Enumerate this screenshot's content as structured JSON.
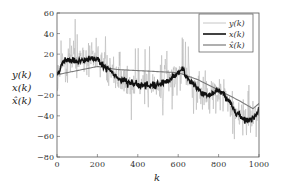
{
  "chart_data": {
    "type": "line",
    "title": "",
    "xlabel": "k",
    "ylabel_lines": [
      "y(k)",
      "x(k)",
      "x̂(k)"
    ],
    "xlim": [
      0,
      1000
    ],
    "ylim": [
      -80,
      60
    ],
    "xticks": [
      0,
      200,
      400,
      600,
      800,
      1000
    ],
    "yticks": [
      -80,
      -60,
      -40,
      -20,
      0,
      20,
      40,
      60
    ],
    "grid": false,
    "legend_position": "upper right",
    "series": [
      {
        "name": "y(k)",
        "color": "#b8b8b8",
        "style": "thin noisy line (measurements = x(k) + noise, ~±15 spikes up to ±30)",
        "noise_amplitude": 12
      },
      {
        "name": "x(k)",
        "color": "#111111",
        "style": "thick line",
        "x": [
          0,
          20,
          40,
          80,
          120,
          160,
          200,
          230,
          260,
          300,
          350,
          400,
          450,
          500,
          550,
          600,
          620,
          640,
          680,
          720,
          760,
          800,
          830,
          860,
          880,
          920,
          950,
          980,
          1000
        ],
        "values": [
          0,
          8,
          15,
          14,
          13,
          15,
          16,
          8,
          4,
          -3,
          -7,
          -10,
          -11,
          -9,
          -6,
          2,
          5,
          -2,
          -10,
          -18,
          -20,
          -15,
          -20,
          -28,
          -35,
          -42,
          -45,
          -40,
          -33
        ]
      },
      {
        "name": "x̂(k)",
        "color": "#7a7a7a",
        "style": "medium smooth line",
        "x": [
          0,
          100,
          200,
          300,
          400,
          500,
          600,
          700,
          800,
          900,
          970,
          1000
        ],
        "values": [
          0,
          4,
          8,
          5,
          4,
          3,
          2,
          -5,
          -15,
          -25,
          -33,
          -28
        ]
      }
    ]
  },
  "legend": {
    "items": [
      {
        "label": "y(k)",
        "color": "#b8b8b8",
        "width": 0.8
      },
      {
        "label": "x(k)",
        "color": "#111111",
        "width": 1.6
      },
      {
        "label": "x̂(k)",
        "color": "#7a7a7a",
        "width": 1.2
      }
    ]
  },
  "axes": {
    "xlabel": "k",
    "ylabels": [
      "y(k)",
      "x(k)",
      "x̂(k)"
    ],
    "xtick_labels": [
      "0",
      "200",
      "400",
      "600",
      "800",
      "1000"
    ],
    "ytick_labels": [
      "−80",
      "−60",
      "−40",
      "−20",
      "0",
      "20",
      "40",
      "60"
    ]
  }
}
